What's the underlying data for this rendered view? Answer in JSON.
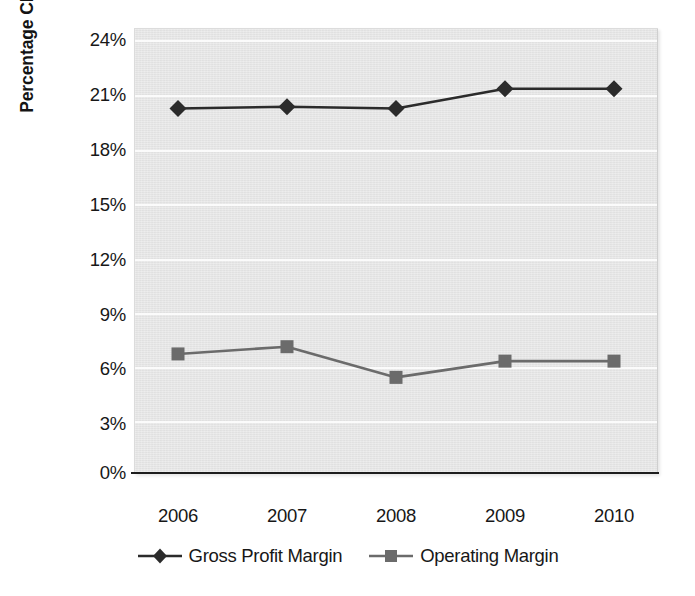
{
  "chart_data": {
    "type": "line",
    "title": "",
    "subtitle": "",
    "xlabel": "",
    "ylabel": "Percentage Change",
    "categories": [
      "2006",
      "2007",
      "2008",
      "2009",
      "2010"
    ],
    "series": [
      {
        "name": "Gross Profit Margin",
        "marker": "diamond",
        "color": "#2b2b2b",
        "values": [
          20.2,
          20.3,
          20.2,
          21.3,
          21.3
        ]
      },
      {
        "name": "Operating Margin",
        "marker": "square",
        "color": "#6b6b6b",
        "values": [
          6.6,
          7.0,
          5.3,
          6.2,
          6.2
        ]
      }
    ],
    "ylim": [
      0,
      24
    ],
    "ytick_step": 3,
    "ytick_labels": [
      "24%",
      "21%",
      "18%",
      "15%",
      "12%",
      "9%",
      "6%",
      "3%",
      "0%"
    ],
    "ytick_values": [
      24,
      21,
      18,
      15,
      12,
      9,
      6,
      3,
      0
    ],
    "grid": true,
    "grid_axis": "y",
    "legend_position": "bottom",
    "plot_background": "#e7e7e7",
    "gridline_color": "#fbfbfb",
    "axis_line_color": "#1d1d1d",
    "value_format": "percent"
  },
  "legend": {
    "items": [
      {
        "label": "Gross Profit Margin",
        "marker": "diamond",
        "color": "#2b2b2b"
      },
      {
        "label": "Operating Margin",
        "marker": "square",
        "color": "#6b6b6b"
      }
    ]
  }
}
